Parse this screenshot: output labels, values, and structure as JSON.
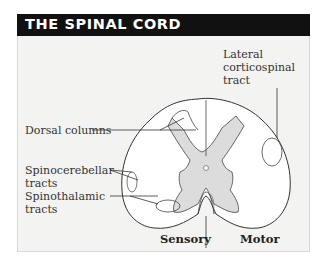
{
  "title": "THE SPINAL CORD",
  "labels": {
    "lateral_corticospinal_1": "Lateral",
    "lateral_corticospinal_2": "corticospinal",
    "lateral_corticospinal_3": "tract",
    "dorsal_columns": "Dorsal columns",
    "spinocerebellar_1": "Spinocerebellar",
    "spinocerebellar_2": "tracts",
    "spinothalamic_1": "Spinothalamic",
    "spinothalamic_2": "tracts",
    "sensory": "Sensory",
    "motor": "Motor"
  },
  "colors": {
    "header_bg": "#111111",
    "panel_bg": "#f3f3f1",
    "grey_matter": "#dcdcdc",
    "outline": "#333333"
  }
}
